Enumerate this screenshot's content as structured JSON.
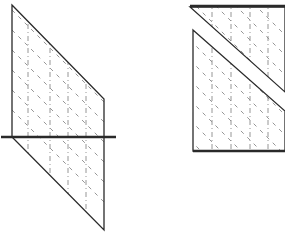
{
  "diagram": {
    "colors": {
      "stroke": "#2a2a2a",
      "hatch": "#8a8a8a",
      "background": "#ffffff"
    },
    "left_figure": {
      "name": "parallelogram-crossed-by-line",
      "outline": [
        [
          12,
          5
        ],
        [
          104,
          99
        ],
        [
          104,
          230
        ],
        [
          12,
          137
        ]
      ],
      "horizontal_line": {
        "x1": 1,
        "y1": 137,
        "x2": 116,
        "y2": 137
      },
      "hatch_verticals_x": [
        28,
        50,
        68,
        86
      ],
      "hatch_diagonal_offsets": [
        -110,
        -90,
        -70,
        -50,
        -30,
        -10,
        10,
        30,
        50,
        70,
        90,
        110
      ]
    },
    "right_figure": {
      "name": "rectangle-cut-by-diagonal-band",
      "rect": {
        "x": 193,
        "y": 6,
        "right": 285,
        "bottom": 151
      },
      "upper_piece": [
        [
          190,
          7
        ],
        [
          285,
          7
        ],
        [
          285,
          92
        ]
      ],
      "lower_piece": [
        [
          193,
          30
        ],
        [
          285,
          111
        ],
        [
          285,
          151
        ],
        [
          193,
          151
        ]
      ],
      "hatch_verticals_x": [
        212,
        231,
        250,
        268
      ],
      "hatch_diagonal_offsets": [
        -60,
        -40,
        -20,
        0,
        20,
        40,
        60,
        80,
        100,
        120,
        140
      ]
    }
  }
}
